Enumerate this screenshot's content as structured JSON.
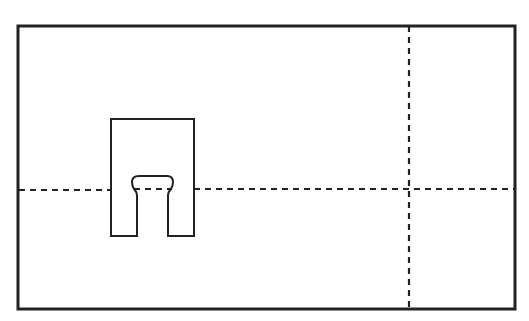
{
  "diagram": {
    "type": "technical-line-drawing",
    "colors": {
      "background": "#ffffff",
      "stroke": "#222222"
    },
    "outer_rectangle": {
      "x": 18,
      "y": 26,
      "width": 497,
      "height": 283
    },
    "centerlines": {
      "horizontal_y": 189,
      "vertical_x": 413
    },
    "slotted_tab": {
      "outer": {
        "x": 111,
        "y": 119,
        "width": 83,
        "height": 117
      },
      "slot_width_bottom": 31,
      "slot_head_width": 43,
      "slot_top_y": 176
    }
  }
}
